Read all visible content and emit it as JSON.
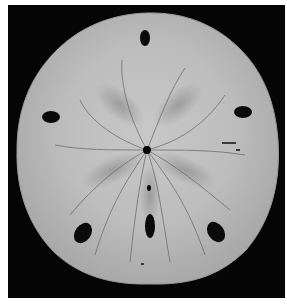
{
  "image": {
    "subject": "sand dollar",
    "style": "black-and-white photograph",
    "colors": {
      "page_background": "#ffffff",
      "photo_background": "#050505",
      "shell_light": "#d8d8d8",
      "shell_mid": "#b9b9b9",
      "shell_shadow": "#8f8f8f",
      "groove": "#6a6a6a",
      "hole": "#0a0a0a"
    },
    "center_hole": {
      "x": 147,
      "y": 150,
      "r": 4
    },
    "lunules": [
      {
        "cx": 145,
        "cy": 38,
        "rx": 5,
        "ry": 8,
        "rot": 0
      },
      {
        "cx": 51,
        "cy": 117,
        "rx": 9,
        "ry": 6,
        "rot": 0
      },
      {
        "cx": 243,
        "cy": 112,
        "rx": 9,
        "ry": 6,
        "rot": 0
      },
      {
        "cx": 83,
        "cy": 233,
        "rx": 8,
        "ry": 11,
        "rot": 35
      },
      {
        "cx": 150,
        "cy": 226,
        "rx": 5,
        "ry": 12,
        "rot": 0
      },
      {
        "cx": 216,
        "cy": 232,
        "rx": 8,
        "ry": 11,
        "rot": -35
      }
    ]
  }
}
